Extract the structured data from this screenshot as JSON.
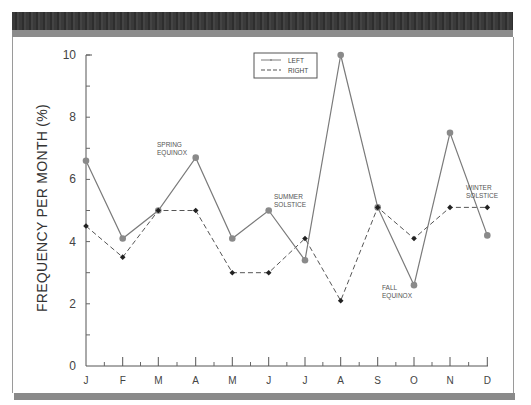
{
  "chart_data": {
    "type": "line",
    "title": "",
    "xlabel": "",
    "ylabel": "FREQUENCY PER MONTH (%)",
    "ylim": [
      0,
      10
    ],
    "yticks": [
      0,
      2,
      4,
      6,
      8,
      10
    ],
    "categories": [
      "J",
      "F",
      "M",
      "A",
      "M",
      "J",
      "J",
      "A",
      "S",
      "O",
      "N",
      "D"
    ],
    "series": [
      {
        "name": "LEFT",
        "style": "solid",
        "marker": "circle",
        "values": [
          6.6,
          4.1,
          5.0,
          6.7,
          4.1,
          5.0,
          3.4,
          10.0,
          5.1,
          2.6,
          7.5,
          4.2
        ]
      },
      {
        "name": "RIGHT",
        "style": "dashed",
        "marker": "diamond",
        "values": [
          4.5,
          3.5,
          5.0,
          5.0,
          3.0,
          3.0,
          4.1,
          2.1,
          5.1,
          4.1,
          5.1,
          5.1
        ]
      }
    ],
    "annotations": [
      {
        "text": [
          "SPRING",
          "EQUINOX"
        ],
        "near": "M"
      },
      {
        "text": [
          "SUMMER",
          "SOLSTICE"
        ],
        "near": "J (June)"
      },
      {
        "text": [
          "FALL",
          "EQUINOX"
        ],
        "near": "O"
      },
      {
        "text": [
          "WINTER",
          "SOLSTICE"
        ],
        "near": "D"
      }
    ],
    "legend": {
      "position": "top-center",
      "entries": [
        "LEFT",
        "RIGHT"
      ]
    },
    "grid": false
  },
  "axis": {
    "ylabel": "FREQUENCY PER MONTH (%)"
  },
  "colors": {
    "left_line": "#7a7a7a",
    "left_marker": "#8a8a8a",
    "right_line": "#555555",
    "right_marker": "#222222",
    "frame_dark": "#3a3a3a",
    "frame_light": "#8c8c8c"
  }
}
